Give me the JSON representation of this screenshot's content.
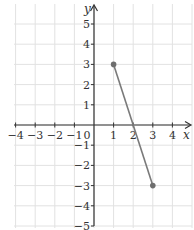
{
  "chart_data": {
    "type": "line",
    "title": "",
    "xlabel": "x",
    "ylabel": "y",
    "xlim": [
      -4,
      5
    ],
    "ylim": [
      -5,
      5
    ],
    "grid": true,
    "x_ticks": [
      -4,
      -3,
      -2,
      -1,
      0,
      1,
      2,
      3,
      4
    ],
    "y_ticks": [
      5,
      4,
      3,
      2,
      1,
      -1,
      -2,
      -3,
      -4,
      -5
    ],
    "x_tick_labels": [
      "−4",
      "−3",
      "−2",
      "−1",
      "0",
      "1",
      "2",
      "3",
      "4"
    ],
    "y_tick_labels": [
      "5",
      "4",
      "3",
      "2",
      "1",
      "−1",
      "−2",
      "−3",
      "−4",
      "−5"
    ],
    "series": [
      {
        "name": "segment",
        "points": [
          {
            "x": 1,
            "y": 3
          },
          {
            "x": 3,
            "y": -3
          }
        ],
        "color": "#7a7a7a",
        "endpoints": "filled-dots"
      }
    ]
  },
  "colors": {
    "grid": "#e2e2e2",
    "axis": "#333333",
    "line": "#7a7a7a",
    "point": "#6e6e6e"
  }
}
